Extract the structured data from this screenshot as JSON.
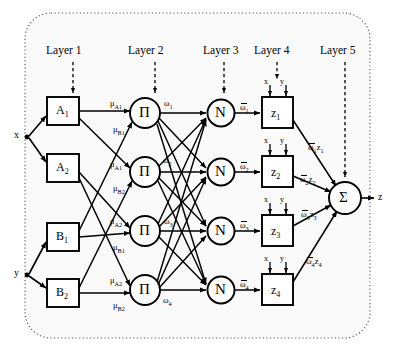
{
  "diagram": {
    "background": "#ffffff",
    "stroke": "#000000",
    "panel_fill": "#fafafa",
    "layer_labels": [
      {
        "text": "Layer 1",
        "x": 46,
        "y": 52,
        "arrow_x": 73,
        "arrow_y0": 62,
        "arrow_y1": 93
      },
      {
        "text": "Layer 2",
        "x": 128,
        "y": 52,
        "arrow_x": 155,
        "arrow_y0": 62,
        "arrow_y1": 93
      },
      {
        "text": "Layer 3",
        "x": 203,
        "y": 52,
        "arrow_x": 224,
        "arrow_y0": 62,
        "arrow_y1": 93
      },
      {
        "text": "Layer 4",
        "x": 254,
        "y": 52,
        "arrow_x": 277,
        "arrow_y0": 62,
        "arrow_y1": 80
      },
      {
        "text": "Layer 5",
        "x": 320,
        "y": 52,
        "arrow_x": 345,
        "arrow_y0": 62,
        "arrow_y1": 178
      }
    ],
    "inputs": [
      {
        "name": "x",
        "label": "x",
        "x": 14,
        "y": 134,
        "dot_x": 27,
        "dot_y": 137
      },
      {
        "name": "y",
        "label": "y",
        "x": 14,
        "y": 272,
        "dot_x": 27,
        "dot_y": 275
      }
    ],
    "output": {
      "label": "z",
      "x": 378,
      "y": 201
    },
    "membership_nodes": [
      {
        "label": "A",
        "sub": "1",
        "cx": 63,
        "cy": 111
      },
      {
        "label": "A",
        "sub": "2",
        "cx": 63,
        "cy": 168
      },
      {
        "label": "B",
        "sub": "1",
        "cx": 63,
        "cy": 237
      },
      {
        "label": "B",
        "sub": "2",
        "cx": 63,
        "cy": 293
      }
    ],
    "rule_nodes": [
      {
        "label": "Π",
        "cx": 145,
        "cy": 113
      },
      {
        "label": "Π",
        "cx": 145,
        "cy": 172
      },
      {
        "label": "Π",
        "cx": 145,
        "cy": 231
      },
      {
        "label": "Π",
        "cx": 145,
        "cy": 290
      }
    ],
    "norm_nodes": [
      {
        "label": "N",
        "cx": 221,
        "cy": 113
      },
      {
        "label": "N",
        "cx": 221,
        "cy": 172
      },
      {
        "label": "N",
        "cx": 221,
        "cy": 231
      },
      {
        "label": "N",
        "cx": 221,
        "cy": 290
      }
    ],
    "consequent_nodes": [
      {
        "label": "z",
        "sub": "1",
        "cx": 277,
        "cy": 113
      },
      {
        "label": "z",
        "sub": "2",
        "cx": 277,
        "cy": 172
      },
      {
        "label": "z",
        "sub": "3",
        "cx": 277,
        "cy": 231
      },
      {
        "label": "z",
        "sub": "4",
        "cx": 277,
        "cy": 290
      }
    ],
    "sum_node": {
      "label": "Σ",
      "cx": 345,
      "cy": 198,
      "r": 16
    },
    "mu_labels": [
      {
        "base": "μ",
        "sub": "A1",
        "x": 110,
        "y": 104
      },
      {
        "base": "μ",
        "sub": "B1",
        "x": 113,
        "y": 130
      },
      {
        "base": "μ",
        "sub": "A1",
        "x": 110,
        "y": 165
      },
      {
        "base": "μ",
        "sub": "B2",
        "x": 113,
        "y": 189
      },
      {
        "base": "μ",
        "sub": "A2",
        "x": 110,
        "y": 222
      },
      {
        "base": "μ",
        "sub": "B1",
        "x": 113,
        "y": 248
      },
      {
        "base": "μ",
        "sub": "A2",
        "x": 110,
        "y": 281
      },
      {
        "base": "μ",
        "sub": "B2",
        "x": 113,
        "y": 306
      }
    ],
    "omega_labels": [
      {
        "base": "ω",
        "sub": "1",
        "x": 164,
        "y": 104
      },
      {
        "base": "ω",
        "sub": "2",
        "x": 163,
        "y": 161
      },
      {
        "base": "ω",
        "sub": "3",
        "x": 164,
        "y": 222
      },
      {
        "base": "ω",
        "sub": "4",
        "x": 163,
        "y": 300
      }
    ],
    "norm_omega_labels": [
      {
        "base": "ω",
        "sub": "1",
        "x": 240,
        "y": 108
      },
      {
        "base": "ω",
        "sub": "2",
        "x": 240,
        "y": 167
      },
      {
        "base": "ω",
        "sub": "3",
        "x": 240,
        "y": 226
      },
      {
        "base": "ω",
        "sub": "4",
        "x": 240,
        "y": 285
      }
    ],
    "weighted_labels": [
      {
        "base": "ω",
        "sub": "1",
        "tail": "z",
        "tailsub": "1",
        "x": 308,
        "y": 148
      },
      {
        "base": "ω",
        "sub": "2",
        "tail": "z",
        "tailsub": "2",
        "x": 300,
        "y": 180
      },
      {
        "base": "ω",
        "sub": "3",
        "tail": "z",
        "tailsub": "3",
        "x": 301,
        "y": 215
      },
      {
        "base": "ω",
        "sub": "4",
        "tail": "z",
        "tailsub": "4",
        "x": 306,
        "y": 262
      }
    ],
    "xy_inputs": [
      {
        "x_label": "x",
        "y_label": "y",
        "box_cy": 113
      },
      {
        "x_label": "x",
        "y_label": "y",
        "box_cy": 172
      },
      {
        "x_label": "x",
        "y_label": "y",
        "box_cy": 231
      },
      {
        "x_label": "x",
        "y_label": "y",
        "box_cy": 290
      }
    ]
  }
}
